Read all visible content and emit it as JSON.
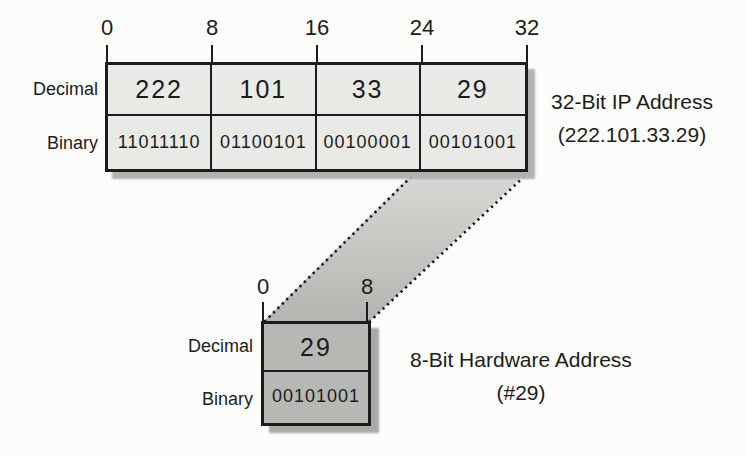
{
  "colors": {
    "ink": "#1c1c1c",
    "paper": "#fcfcfa",
    "ip_table_fill": "#e9e9e6",
    "hw_table_fill": "#b7b7b4",
    "funnel_top": "#d8d8d5",
    "funnel_bottom": "#b4b4b1",
    "ip_table_shadow": "#b2b2b0",
    "hw_table_shadow": "#a9a9a7"
  },
  "ip_address_section": {
    "bit_ruler": [
      "0",
      "8",
      "16",
      "24",
      "32"
    ],
    "row_labels": {
      "decimal": "Decimal",
      "binary": "Binary"
    },
    "decimal_octets": [
      "222",
      "101",
      "33",
      "29"
    ],
    "binary_octets": [
      "11011110",
      "01100101",
      "00100001",
      "00101001"
    ],
    "caption": [
      "32-Bit IP Address",
      "(222.101.33.29)"
    ]
  },
  "hardware_address_section": {
    "bit_ruler": [
      "0",
      "8"
    ],
    "row_labels": {
      "decimal": "Decimal",
      "binary": "Binary"
    },
    "decimal_octets": [
      "29"
    ],
    "binary_octets": [
      "00101001"
    ],
    "caption": [
      "8-Bit Hardware Address",
      "(#29)"
    ]
  }
}
